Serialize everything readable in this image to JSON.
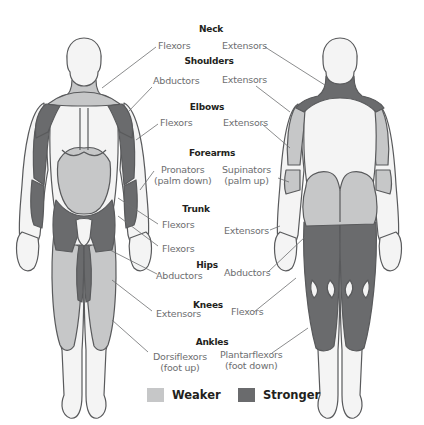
{
  "colors": {
    "weaker": "#c6c7c8",
    "stronger": "#6a6b6d",
    "outline": "#595a5c",
    "skin": "#f4f4f4",
    "leader": "#6d6e70",
    "label": "#6d6e70",
    "heading": "#231f20"
  },
  "groups": [
    {
      "heading": "Neck",
      "front": "Flexors",
      "back": "Extensors"
    },
    {
      "heading": "Shoulders",
      "front": "Abductors",
      "back": "Extensors"
    },
    {
      "heading": "Elbows",
      "front": "Flexors",
      "back": "Extensors"
    },
    {
      "heading": "Forearms",
      "front_line1": "Pronators",
      "front_line2": "(palm down)",
      "back_line1": "Supinators",
      "back_line2": "(palm up)"
    },
    {
      "heading": "Trunk",
      "front": "Flexors",
      "front_extra": "Flexors",
      "back": "Extensors"
    },
    {
      "heading": "Hips",
      "front": "Abductors",
      "back": "Abductors"
    },
    {
      "heading": "Knees",
      "front": "Extensors",
      "back": "Flexors"
    },
    {
      "heading": "Ankles",
      "front_line1": "Dorsiflexors",
      "front_line2": "(foot up)",
      "back_line1": "Plantarflexors",
      "back_line2": "(foot down)"
    }
  ],
  "legend": {
    "weaker_label": "Weaker",
    "stronger_label": "Stronger"
  }
}
